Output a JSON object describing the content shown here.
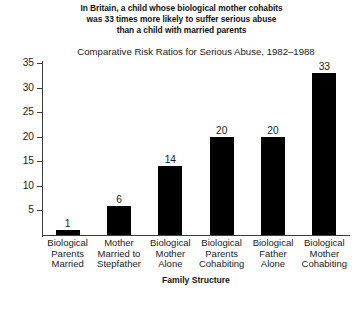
{
  "headline": {
    "lines": [
      "In Britain, a child whose biological mother cohabits",
      "was 33 times more likely to suffer serious abuse",
      "than a child with married parents"
    ]
  },
  "chart_data": {
    "type": "bar",
    "title": "Comparative Risk Ratios for Serious Abuse, 1982–1988",
    "xlabel": "Family Structure",
    "ylabel": "",
    "ylim": [
      0,
      35
    ],
    "yticks": [
      5,
      10,
      15,
      20,
      25,
      30,
      35
    ],
    "grid": false,
    "legend": false,
    "bar_color": "#000000",
    "categories": [
      "Biological Parents Married",
      "Mother Married to Stepfather",
      "Biological Mother Alone",
      "Biological Parents Cohabiting",
      "Biological Father Alone",
      "Biological Mother Cohabiting"
    ],
    "category_lines": [
      [
        "Biological",
        "Parents",
        "Married"
      ],
      [
        "Mother",
        "Married to",
        "Stepfather"
      ],
      [
        "Biological",
        "Mother",
        "Alone"
      ],
      [
        "Biological",
        "Parents",
        "Cohabiting"
      ],
      [
        "Biological",
        "Father",
        "Alone"
      ],
      [
        "Biological",
        "Mother",
        "Cohabiting"
      ]
    ],
    "values": [
      1,
      6,
      14,
      20,
      20,
      33
    ],
    "data_labels": [
      "1",
      "6",
      "14",
      "20",
      "20",
      "33"
    ]
  }
}
